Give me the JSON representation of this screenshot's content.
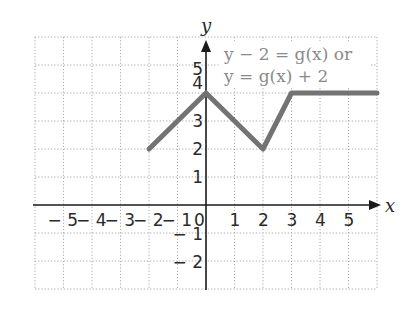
{
  "chart_data": {
    "type": "line",
    "title": "",
    "xlabel": "x",
    "ylabel": "y",
    "xlim": [
      -6,
      6
    ],
    "ylim": [
      -3,
      6
    ],
    "grid": true,
    "x_ticks": [
      -5,
      -4,
      -3,
      -2,
      -1,
      0,
      1,
      2,
      3,
      4,
      5
    ],
    "y_ticks": [
      -2,
      -1,
      1,
      2,
      3,
      4,
      5
    ],
    "x_tick_labels": [
      "− 5",
      "− 4",
      "− 3",
      "− 2",
      "− 1",
      "0",
      "1",
      "2",
      "3",
      "4",
      "5"
    ],
    "y_tick_labels": [
      "− 2",
      "− 1",
      "1",
      "2",
      "3",
      "4",
      "5"
    ],
    "series": [
      {
        "name": "y = g(x) + 2",
        "points": [
          {
            "x": -2,
            "y": 2
          },
          {
            "x": 0,
            "y": 4
          },
          {
            "x": 2,
            "y": 2
          },
          {
            "x": 3,
            "y": 4
          },
          {
            "x": 6,
            "y": 4
          }
        ],
        "color": "#737373"
      }
    ],
    "annotations": [
      {
        "text": "y − 2 = g(x) or",
        "x": 0.6,
        "y": 5.4
      },
      {
        "text": "y = g(x) + 2",
        "x": 0.6,
        "y": 4.6
      }
    ]
  },
  "colors": {
    "curve": "#737373",
    "axes": "#1a1a1a",
    "grid": "#a8a8a8",
    "annotation": "#8a8a8a",
    "background": "#ffffff"
  }
}
